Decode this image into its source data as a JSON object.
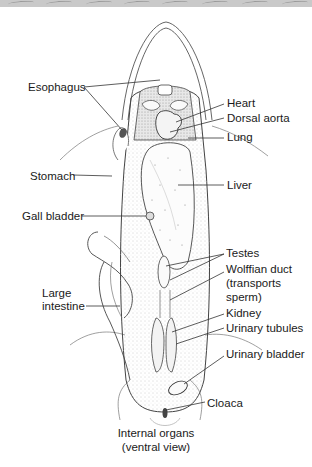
{
  "figure": {
    "title": "Internal organs (ventral view)",
    "caption_line1": "Internal organs",
    "caption_line2": "(ventral view)"
  },
  "labels": {
    "left": [
      {
        "id": "esophagus",
        "text": "Esophagus"
      },
      {
        "id": "stomach",
        "text": "Stomach"
      },
      {
        "id": "gall-bladder",
        "text": "Gall bladder"
      },
      {
        "id": "large-intestine-1",
        "text": "Large"
      },
      {
        "id": "large-intestine-2",
        "text": "intestine"
      }
    ],
    "right": [
      {
        "id": "heart",
        "text": "Heart"
      },
      {
        "id": "dorsal-aorta",
        "text": "Dorsal aorta"
      },
      {
        "id": "lung",
        "text": "Lung"
      },
      {
        "id": "liver",
        "text": "Liver"
      },
      {
        "id": "testes",
        "text": "Testes"
      },
      {
        "id": "wolffian-duct-1",
        "text": "Wolffian duct"
      },
      {
        "id": "wolffian-duct-2",
        "text": "(transports"
      },
      {
        "id": "wolffian-duct-3",
        "text": "sperm)"
      },
      {
        "id": "kidney",
        "text": "Kidney"
      },
      {
        "id": "urinary-tubules",
        "text": "Urinary tubules"
      },
      {
        "id": "urinary-bladder",
        "text": "Urinary bladder"
      },
      {
        "id": "cloaca",
        "text": "Cloaca"
      }
    ]
  },
  "colors": {
    "line": "#333333",
    "banner": "#c9c9c9",
    "stipple": "#bdbdbd"
  }
}
